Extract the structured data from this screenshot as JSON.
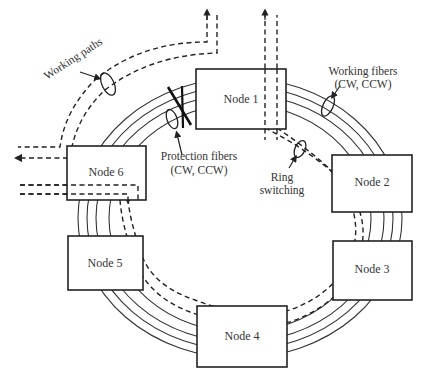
{
  "diagram": {
    "type": "ring-network",
    "nodes": [
      {
        "id": "node-1",
        "label": "Node 1"
      },
      {
        "id": "node-2",
        "label": "Node 2"
      },
      {
        "id": "node-3",
        "label": "Node 3"
      },
      {
        "id": "node-4",
        "label": "Node 4"
      },
      {
        "id": "node-5",
        "label": "Node 5"
      },
      {
        "id": "node-6",
        "label": "Node 6"
      }
    ],
    "annotations": {
      "working_paths": "Working paths",
      "working_fibers_line1": "Working fibers",
      "working_fibers_line2": "(CW, CCW)",
      "protection_fibers_line1": "Protection fibers",
      "protection_fibers_line2": "(CW, CCW)",
      "ring_switching_line1": "Ring",
      "ring_switching_line2": "switching"
    },
    "colors": {
      "stroke": "#222222",
      "background": "#ffffff"
    }
  }
}
